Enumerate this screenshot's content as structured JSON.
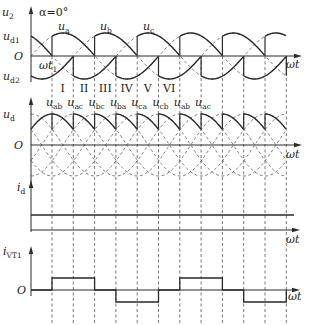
{
  "figure": {
    "alpha_label": "α=0°",
    "origin_label": "O",
    "omega_t": "ωt",
    "omega_t1": "ωt",
    "omega_t1_sub": "1",
    "panels": {
      "u2": {
        "label": "u",
        "sub": "2",
        "ud1": "u",
        "ud1_sub": "d1",
        "ud2": "u",
        "ud2_sub": "d2",
        "phase_labels": [
          {
            "text": "u",
            "sub": "a",
            "x": 62
          },
          {
            "text": "u",
            "sub": "b",
            "x": 104
          },
          {
            "text": "u",
            "sub": "c",
            "x": 147
          }
        ]
      },
      "ud": {
        "label": "u",
        "sub": "d",
        "line_labels": [
          {
            "text": "u",
            "sub": "ab"
          },
          {
            "text": "u",
            "sub": "ac"
          },
          {
            "text": "u",
            "sub": "bc"
          },
          {
            "text": "u",
            "sub": "ba"
          },
          {
            "text": "u",
            "sub": "ca"
          },
          {
            "text": "u",
            "sub": "cb"
          },
          {
            "text": "u",
            "sub": "ab"
          },
          {
            "text": "u",
            "sub": "ac"
          }
        ]
      },
      "id": {
        "label": "i",
        "sub": "d"
      },
      "ivt1": {
        "label": "i",
        "sub": "VT1"
      }
    },
    "intervals": [
      "I",
      "II",
      "III",
      "IV",
      "V",
      "VI"
    ],
    "dashed_x": [
      52,
      73.3,
      94.6,
      115.9,
      137.2,
      158.5,
      179.8,
      201.1,
      222.4,
      243.7,
      265,
      286.3
    ],
    "ivt1_pattern": [
      1,
      1,
      0,
      -1,
      -1,
      0,
      1,
      1,
      0,
      -1,
      -1
    ]
  },
  "colors": {
    "line": "#2a2a2a",
    "dash": "#555555"
  }
}
